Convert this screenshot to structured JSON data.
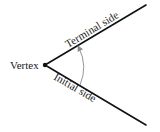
{
  "diagram": {
    "labels": {
      "vertex": "Vertex",
      "terminal_side": "Terminal side",
      "initial_side": "Initial side"
    },
    "colors": {
      "line": "#111111",
      "arc": "#8a8a8a",
      "text": "#1a1a1a"
    },
    "arc_direction": "from initial side to terminal side (arrowhead at terminal side)"
  }
}
